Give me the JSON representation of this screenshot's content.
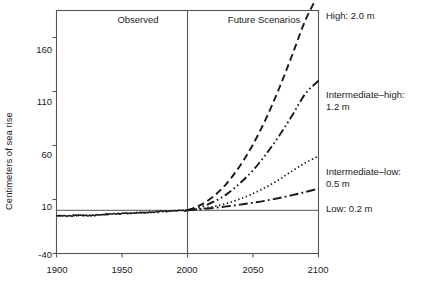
{
  "chart_data": {
    "type": "line",
    "title": "",
    "xlabel": "",
    "ylabel": "Centimeters of sea rise",
    "xlim": [
      1900,
      2100
    ],
    "ylim": [
      -40,
      185
    ],
    "xticks": [
      1900,
      1950,
      2000,
      2050,
      2100
    ],
    "xtick_labels": [
      "1900",
      "1950",
      "2000",
      "2050",
      "2100"
    ],
    "yticks": [
      -40,
      10,
      60,
      110,
      160
    ],
    "ytick_labels": [
      "-40",
      "10",
      "60",
      "110",
      "160"
    ],
    "grid": false,
    "legend_position": "right-inline-annotations",
    "panel_labels": [
      {
        "text": "Observed",
        "x": 1950
      },
      {
        "text": "Future Scenarios",
        "x": 2050
      }
    ],
    "divider_year": 2000,
    "zero_reference_line": 0,
    "series": [
      {
        "name": "Observed",
        "label": "Observed",
        "style": "solid-noisy",
        "x": [
          1900,
          1905,
          1910,
          1915,
          1920,
          1925,
          1930,
          1935,
          1940,
          1945,
          1950,
          1955,
          1960,
          1965,
          1970,
          1975,
          1980,
          1985,
          1990,
          1995,
          2000
        ],
        "values": [
          -5.0,
          -5.2,
          -5.0,
          -4.6,
          -4.8,
          -4.9,
          -4.4,
          -4.0,
          -3.5,
          -3.3,
          -3.0,
          -2.6,
          -2.4,
          -2.0,
          -1.8,
          -1.4,
          -1.1,
          -0.9,
          -0.6,
          -0.3,
          0.0
        ]
      },
      {
        "name": "High",
        "label": "High: 2.0 m",
        "style": "dashed",
        "x": [
          2000,
          2010,
          2020,
          2030,
          2040,
          2050,
          2060,
          2070,
          2080,
          2090,
          2100
        ],
        "values": [
          0,
          5,
          13,
          25,
          41,
          61,
          85,
          113,
          144,
          176,
          200
        ]
      },
      {
        "name": "Intermediate-high",
        "label": "Intermediate–high: 1.2 m",
        "label_line1": "Intermediate–high:",
        "label_line2": "1.2 m",
        "style": "dash-dot-dot",
        "x": [
          2000,
          2010,
          2020,
          2030,
          2040,
          2050,
          2060,
          2070,
          2080,
          2090,
          2100
        ],
        "values": [
          0,
          3,
          8,
          15,
          25,
          37,
          52,
          69,
          88,
          108,
          120
        ]
      },
      {
        "name": "Intermediate-low",
        "label": "Intermediate–low: 0.5 m",
        "label_line1": "Intermediate–low:",
        "label_line2": "0.5 m",
        "style": "dotted",
        "x": [
          2000,
          2010,
          2020,
          2030,
          2040,
          2050,
          2060,
          2070,
          2080,
          2090,
          2100
        ],
        "values": [
          0,
          1.5,
          3.5,
          6.5,
          10.5,
          15.5,
          21.5,
          28.5,
          36.5,
          44.0,
          50
        ]
      },
      {
        "name": "Low",
        "label": "Low: 0.2 m",
        "style": "dash-dot",
        "x": [
          2000,
          2010,
          2020,
          2030,
          2040,
          2050,
          2060,
          2070,
          2080,
          2090,
          2100
        ],
        "values": [
          0,
          1.0,
          2.2,
          3.6,
          5.2,
          7.0,
          9.0,
          11.4,
          14.0,
          17.0,
          20
        ]
      }
    ]
  },
  "axis": {
    "ylabel": "Centimeters of sea rise",
    "yticks": [
      "160",
      "110",
      "60",
      "10",
      "-40"
    ],
    "xticks": [
      "1900",
      "1950",
      "2000",
      "2050",
      "2100"
    ]
  },
  "panels": {
    "observed": "Observed",
    "future": "Future Scenarios"
  },
  "annotations": {
    "high": "High: 2.0 m",
    "intermediate_high_l1": "Intermediate–high:",
    "intermediate_high_l2": "1.2 m",
    "intermediate_low_l1": "Intermediate–low:",
    "intermediate_low_l2": "0.5 m",
    "low": "Low: 0.2 m"
  },
  "colors": {
    "ink": "#1a1a1a",
    "frame": "#555555",
    "background": "#ffffff"
  }
}
